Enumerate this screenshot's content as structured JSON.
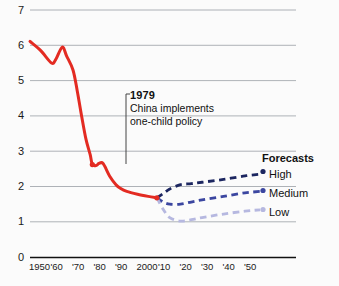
{
  "chart_data": {
    "type": "line",
    "title": "",
    "subtitle": "",
    "xlabel": "",
    "ylabel": "",
    "xlim": [
      1950,
      2060
    ],
    "ylim": [
      0,
      7
    ],
    "grid": true,
    "legend_position": "right",
    "y_ticks": [
      "7",
      "6",
      "5",
      "4",
      "3",
      "2",
      "1",
      "0"
    ],
    "y_tick_values": [
      7,
      6,
      5,
      4,
      3,
      2,
      1,
      0
    ],
    "x_ticks": [
      "1950",
      "'60",
      "'70",
      "'80",
      "'90",
      "2000",
      "'10",
      "'20",
      "'30",
      "'40",
      "'50"
    ],
    "x_tick_values": [
      1950,
      1960,
      1970,
      1980,
      1990,
      2000,
      2010,
      2020,
      2030,
      2040,
      2050
    ],
    "series": [
      {
        "name": "Historical",
        "style": "solid",
        "color": "#e32b22",
        "x": [
          1950,
          1955,
          1960,
          1962,
          1965,
          1967,
          1970,
          1972,
          1974,
          1976,
          1978,
          1979,
          1981,
          1982,
          1984,
          1987,
          1990,
          1992,
          1995,
          2000,
          2005,
          2009
        ],
        "values": [
          6.11,
          5.85,
          5.5,
          5.6,
          5.95,
          5.7,
          5.3,
          4.7,
          4.0,
          3.35,
          2.9,
          2.62,
          2.6,
          2.65,
          2.65,
          2.3,
          2.05,
          1.95,
          1.86,
          1.78,
          1.72,
          1.68
        ]
      },
      {
        "name": "High",
        "style": "dashed",
        "color": "#1c2660",
        "x": [
          2009,
          2012,
          2015,
          2020,
          2025,
          2030,
          2040,
          2050,
          2057
        ],
        "values": [
          1.68,
          1.8,
          1.93,
          2.05,
          2.08,
          2.12,
          2.2,
          2.3,
          2.35
        ]
      },
      {
        "name": "Medium",
        "style": "dashed",
        "color": "#3b46a0",
        "x": [
          2009,
          2012,
          2015,
          2020,
          2025,
          2030,
          2040,
          2050,
          2057
        ],
        "values": [
          1.68,
          1.56,
          1.5,
          1.5,
          1.56,
          1.62,
          1.72,
          1.82,
          1.86
        ]
      },
      {
        "name": "Low",
        "style": "dashed",
        "color": "#b6b8e0",
        "x": [
          2009,
          2012,
          2015,
          2020,
          2025,
          2030,
          2040,
          2050,
          2057
        ],
        "values": [
          1.68,
          1.35,
          1.12,
          1.02,
          1.06,
          1.12,
          1.22,
          1.3,
          1.34
        ]
      }
    ],
    "markers": [
      {
        "name": "1979-marker",
        "x": 1979,
        "y": 2.62,
        "color": "#e32b22"
      },
      {
        "name": "2009-marker",
        "x": 2009,
        "y": 1.68,
        "color": "#e32b22"
      }
    ],
    "annotations": [
      {
        "name": "one-child-policy",
        "year_label": "1979",
        "line1": "China implements",
        "line2": "one-child policy"
      }
    ],
    "legend": {
      "title": "Forecasts",
      "entries": [
        {
          "label": "High",
          "color": "#1c2660"
        },
        {
          "label": "Medium",
          "color": "#3b46a0"
        },
        {
          "label": "Low",
          "color": "#b6b8e0"
        }
      ]
    }
  }
}
